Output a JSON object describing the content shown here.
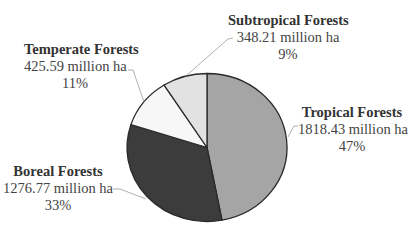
{
  "chart_data": {
    "type": "pie",
    "title": "",
    "unit": "million ha",
    "start_angle": "12 o'clock",
    "direction": "clockwise",
    "categories": [
      "Tropical Forests",
      "Boreal Forests",
      "Temperate Forests",
      "Subtropical Forests"
    ],
    "values": [
      1818.43,
      1276.77,
      425.59,
      348.21
    ],
    "percentages": [
      47,
      33,
      11,
      9
    ],
    "colors": [
      "#a5a5a5",
      "#3c3c3c",
      "#f7f7f7",
      "#e2e2e2"
    ],
    "slices": [
      {
        "name": "Tropical Forests",
        "value": 1818.43,
        "value_label": "1818.43 million ha",
        "pct_label": "47%",
        "color": "#a5a5a5"
      },
      {
        "name": "Boreal Forests",
        "value": 1276.77,
        "value_label": "1276.77 million ha",
        "pct_label": "33%",
        "color": "#3c3c3c"
      },
      {
        "name": "Temperate Forests",
        "value": 425.59,
        "value_label": "425.59 million ha",
        "pct_label": "11%",
        "color": "#f7f7f7"
      },
      {
        "name": "Subtropical Forests",
        "value": 348.21,
        "value_label": "348.21 million ha",
        "pct_label": "9%",
        "color": "#e2e2e2"
      }
    ],
    "legend": "none (data labels with leader lines)"
  }
}
